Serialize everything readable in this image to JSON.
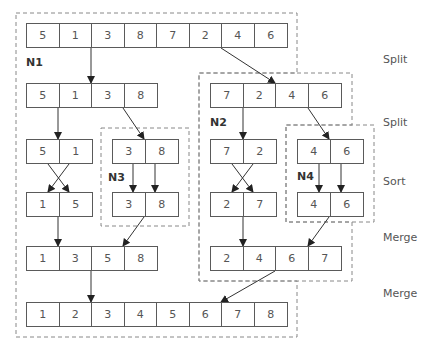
{
  "diagram": {
    "stages": [
      "Split",
      "Split",
      "Sort",
      "Merge",
      "Merge"
    ],
    "nodes": [
      {
        "id": "N1",
        "label": "N1"
      },
      {
        "id": "N2",
        "label": "N2"
      },
      {
        "id": "N3",
        "label": "N3"
      },
      {
        "id": "N4",
        "label": "N4"
      }
    ],
    "arrays": {
      "input": [
        "5",
        "1",
        "3",
        "8",
        "7",
        "2",
        "4",
        "6"
      ],
      "split_left": [
        "5",
        "1",
        "3",
        "8"
      ],
      "split_right": [
        "7",
        "2",
        "4",
        "6"
      ],
      "pair_ll": [
        "5",
        "1"
      ],
      "pair_lr": [
        "3",
        "8"
      ],
      "pair_rl": [
        "7",
        "2"
      ],
      "pair_rr": [
        "4",
        "6"
      ],
      "sorted_ll": [
        "1",
        "5"
      ],
      "sorted_lr": [
        "3",
        "8"
      ],
      "sorted_rl": [
        "2",
        "7"
      ],
      "sorted_rr": [
        "4",
        "6"
      ],
      "merged_left": [
        "1",
        "3",
        "5",
        "8"
      ],
      "merged_right": [
        "2",
        "4",
        "6",
        "7"
      ],
      "output": [
        "1",
        "2",
        "3",
        "4",
        "5",
        "6",
        "7",
        "8"
      ]
    }
  }
}
